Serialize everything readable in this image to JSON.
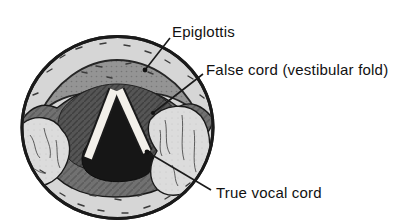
{
  "figure": {
    "labels": {
      "epiglottis": "Epiglottis",
      "false_cord": "False cord (vestibular fold)",
      "true_vocal_cord": "True vocal cord"
    },
    "colors": {
      "background": "#ffffff",
      "outer_ring": "#d6d6d6",
      "epiglottis": "#949494",
      "fold_band": "#717171",
      "vestibule": "#555555",
      "glottis": "#161616",
      "vocal_cord": "#f3f0ea",
      "lobe": "#dcdcdc",
      "outline": "#1a1a1a",
      "label_text": "#111111"
    }
  }
}
